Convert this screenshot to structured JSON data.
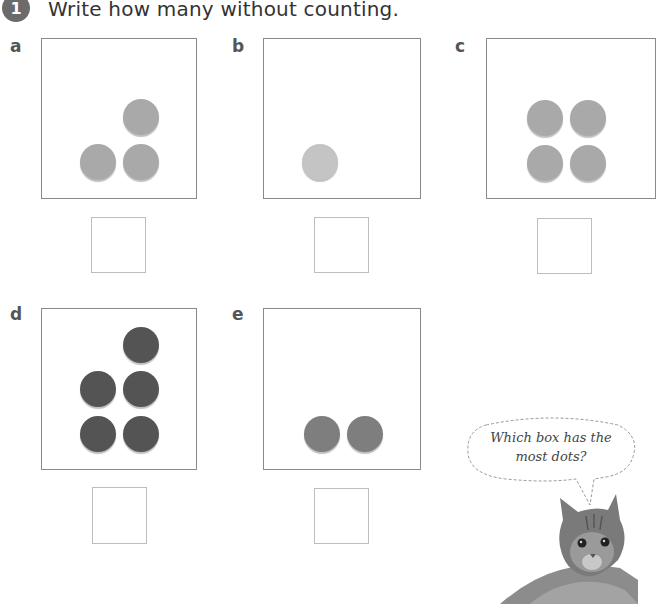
{
  "header": {
    "question_number": "1",
    "instruction": "Write how many without counting."
  },
  "items": [
    {
      "letter": "a",
      "dot_count": 3,
      "dot_color": "#a9a9a9",
      "answer": ""
    },
    {
      "letter": "b",
      "dot_count": 1,
      "dot_color": "#c4c4c4",
      "answer": ""
    },
    {
      "letter": "c",
      "dot_count": 4,
      "dot_color": "#a9a9a9",
      "answer": ""
    },
    {
      "letter": "d",
      "dot_count": 5,
      "dot_color": "#545454",
      "answer": ""
    },
    {
      "letter": "e",
      "dot_count": 2,
      "dot_color": "#7e7e7e",
      "answer": ""
    }
  ],
  "speech_bubble": {
    "line1": "Which box has the",
    "line2": "most dots?"
  },
  "illustration": {
    "label": "kitten"
  }
}
